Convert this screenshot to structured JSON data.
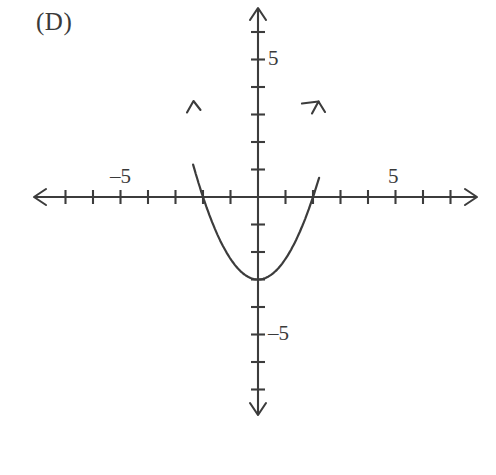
{
  "figure": {
    "choice_label": "(D)",
    "background_color": "#ffffff",
    "ink_color": "#3c3c3c"
  },
  "labels": {
    "x_axis_positive": "5",
    "x_axis_negative": "–5",
    "y_axis_positive": "5",
    "y_axis_negative": "–5"
  },
  "chart_data": {
    "type": "line",
    "title": "",
    "subtitle": "",
    "xlabel": "",
    "ylabel": "",
    "grid": false,
    "legend": "none",
    "axis_style": "double-arrow number lines with unit tick marks",
    "xlim": [
      -8.2,
      8.0
    ],
    "ylim": [
      -7.0,
      6.9
    ],
    "xticks": [
      -8,
      -7,
      -6,
      -5,
      -4,
      -3,
      -2,
      -1,
      1,
      2,
      3,
      4,
      5,
      6,
      7,
      8
    ],
    "yticks": [
      -6,
      -5,
      -4,
      -3,
      -2,
      -1,
      1,
      2,
      3,
      4,
      5,
      6
    ],
    "xtick_labels": [
      {
        "value": -5,
        "text": "–5"
      },
      {
        "value": 5,
        "text": "5"
      }
    ],
    "ytick_labels": [
      {
        "value": -5,
        "text": "–5"
      },
      {
        "value": 5,
        "text": "5"
      }
    ],
    "series": [
      {
        "name": "parabola",
        "equation": "y = 0.75x^2 - 3",
        "vertex": [
          0,
          -3
        ],
        "x_intercepts": [
          -2,
          2
        ],
        "y_intercept": -3,
        "opens": "up",
        "x_range": [
          -2.36,
          2.22
        ],
        "arrow_ends": "both branches end with upward arrowheads",
        "x": [
          -2.36,
          -2.0,
          -1.5,
          -1.0,
          -0.5,
          0.0,
          0.5,
          1.0,
          1.5,
          2.0,
          2.22
        ],
        "y": [
          1.18,
          0.0,
          -1.31,
          -2.25,
          -2.81,
          -3.0,
          -2.81,
          -2.25,
          -1.31,
          0.0,
          0.7
        ]
      }
    ]
  }
}
